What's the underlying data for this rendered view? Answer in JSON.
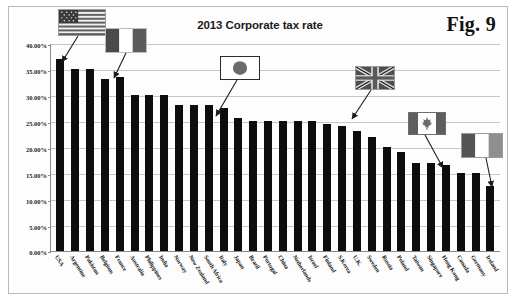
{
  "figure": {
    "label": "Fig. 9",
    "title": "2013 Corporate tax rate"
  },
  "chart_data": {
    "type": "bar",
    "title": "2013 Corporate tax rate",
    "xlabel": "",
    "ylabel": "",
    "ylim": [
      0,
      40
    ],
    "ytick_labels": [
      "40.00%",
      "35.00%",
      "30.00%",
      "25.00%",
      "20.00%",
      "15.00%",
      "10.00%",
      "5.00%",
      "0.00%"
    ],
    "ytick_values": [
      40,
      35,
      30,
      25,
      20,
      15,
      10,
      5,
      0
    ],
    "grid": true,
    "legend": "none",
    "bar_color": "#0d0d0d",
    "categories": [
      "USA",
      "Argentine",
      "Pakistan",
      "Belgium",
      "France",
      "Australia",
      "Philippines",
      "India",
      "Norway",
      "New Zealand",
      "South Africa",
      "Italy",
      "Japan",
      "Brazil",
      "Portugal",
      "China",
      "Netherlands",
      "Israel",
      "Finland",
      "S.Korea",
      "U.K.",
      "Sweden",
      "Russia",
      "Poland",
      "Taiwan",
      "Singapore",
      "Hong Kong",
      "Canada",
      "Germany",
      "Ireland"
    ],
    "values": [
      37.0,
      35.0,
      35.0,
      33.0,
      33.5,
      30.0,
      30.0,
      30.0,
      28.0,
      28.0,
      28.0,
      27.5,
      25.5,
      25.0,
      25.0,
      25.0,
      25.0,
      25.0,
      24.5,
      24.0,
      23.0,
      22.0,
      20.0,
      19.0,
      17.0,
      17.0,
      16.5,
      15.0,
      15.0,
      12.5
    ]
  },
  "callouts": [
    {
      "name": "usa-flag",
      "country": "USA"
    },
    {
      "name": "france-flag",
      "country": "France"
    },
    {
      "name": "japan-flag",
      "country": "Japan"
    },
    {
      "name": "uk-flag",
      "country": "U.K."
    },
    {
      "name": "canada-flag",
      "country": "Canada"
    },
    {
      "name": "ireland-flag",
      "country": "Ireland"
    }
  ]
}
